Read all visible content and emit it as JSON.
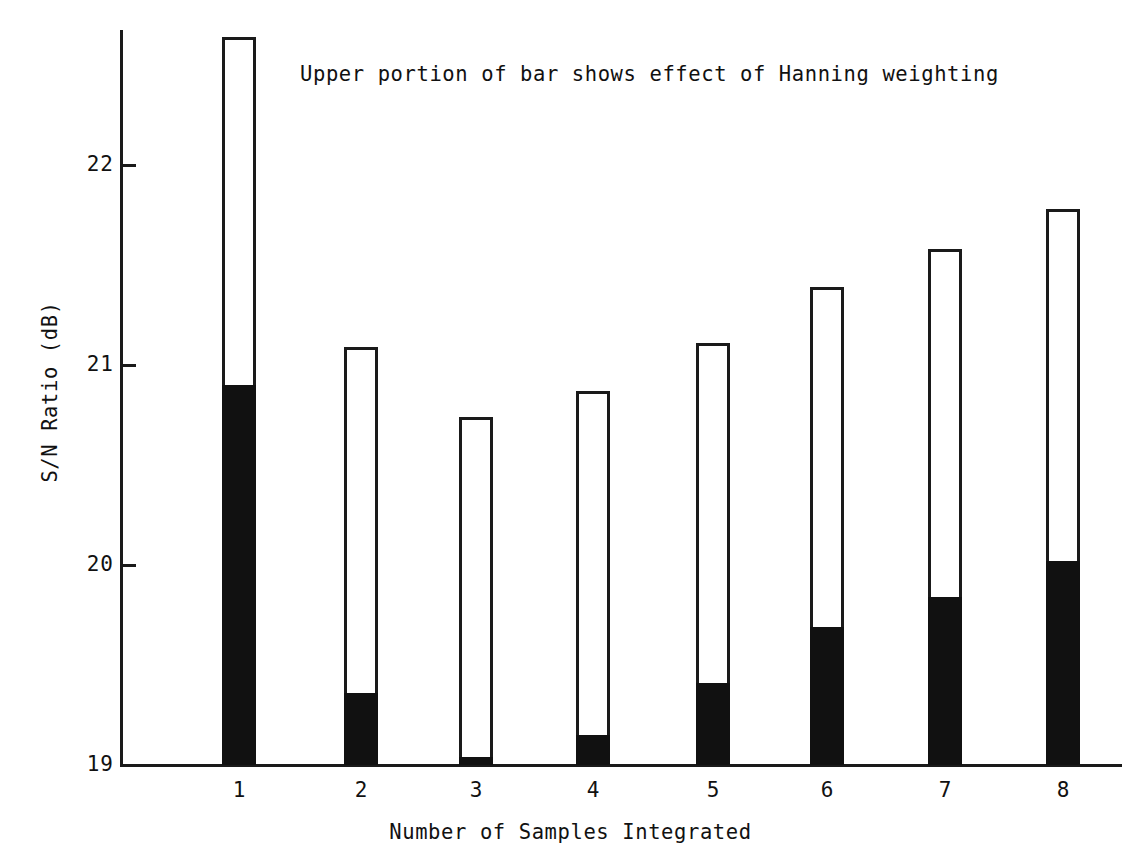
{
  "chart_data": {
    "type": "bar",
    "title": "",
    "annotation": "Upper portion of bar shows effect of Hanning weighting",
    "xlabel": "Number of Samples Integrated",
    "ylabel": "S/N  Ratio  (dB)",
    "categories": [
      "1",
      "2",
      "3",
      "4",
      "5",
      "6",
      "7",
      "8"
    ],
    "ylim": [
      19,
      22.75
    ],
    "yticks": [
      19,
      20,
      21,
      22
    ],
    "ytick_labels": [
      "19",
      "20",
      "21",
      "22"
    ],
    "grid": false,
    "legend": "none",
    "series": [
      {
        "name": "Unweighted (solid black lower portion)",
        "color": "#111111",
        "values": [
          20.9,
          19.36,
          19.04,
          19.15,
          19.41,
          19.69,
          19.84,
          20.02
        ]
      },
      {
        "name": "With Hanning weighting (total bar height)",
        "color": "#ffffff",
        "values": [
          22.64,
          21.09,
          20.74,
          20.87,
          21.11,
          21.39,
          21.58,
          21.78
        ]
      }
    ],
    "bar_total_values": [
      22.64,
      21.09,
      20.74,
      20.87,
      21.11,
      21.39,
      21.58,
      21.78
    ],
    "bar_black_values": [
      20.9,
      19.36,
      19.04,
      19.15,
      19.41,
      19.69,
      19.84,
      20.02
    ],
    "units": "dB"
  },
  "axis": {
    "y_title": "S/N  Ratio  (dB)",
    "x_title": "Number of Samples Integrated",
    "y_labels": [
      "22",
      "21",
      "20",
      "19"
    ],
    "x_labels": [
      "1",
      "2",
      "3",
      "4",
      "5",
      "6",
      "7",
      "8"
    ]
  },
  "note": {
    "text": "Upper portion of bar shows effect of Hanning weighting"
  },
  "colors": {
    "ink": "#111111",
    "paper": "#ffffff",
    "bar_fill": "#111111",
    "bar_outline": "#1a1a1a"
  }
}
